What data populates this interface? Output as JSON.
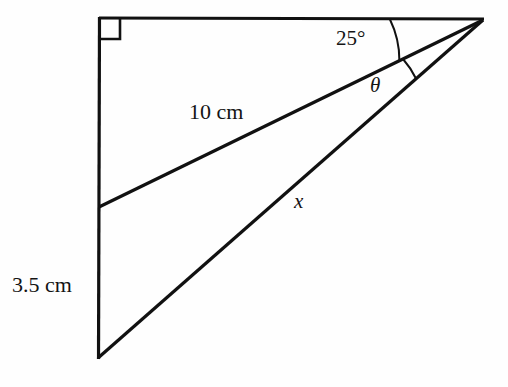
{
  "figure": {
    "background_color": "#fefefe",
    "stroke_color": "#111111",
    "canvas": {
      "width": 508,
      "height": 387
    },
    "vertices": {
      "top_left": {
        "x": 99,
        "y": 18
      },
      "right": {
        "x": 483,
        "y": 20
      },
      "bottom_left": {
        "x": 98,
        "y": 358
      },
      "mid_left": {
        "x": 99,
        "y": 207
      }
    },
    "segments": [
      {
        "name": "top-horizontal",
        "from": "top_left",
        "to": "right"
      },
      {
        "name": "left-vertical",
        "from": "top_left",
        "to": "bottom_left"
      },
      {
        "name": "hypotenuse-x",
        "from": "bottom_left",
        "to": "right"
      },
      {
        "name": "cevian-10cm",
        "from": "mid_left",
        "to": "right"
      }
    ],
    "right_angle_marker": {
      "at": "top_left",
      "size": 21
    }
  },
  "labels": {
    "side_10cm": "10 cm",
    "side_35cm": "3.5 cm",
    "angle_25": "25°",
    "angle_theta": "θ",
    "side_x": "x"
  },
  "angles": {
    "at_right_vertex": [
      {
        "name": "25-degree-angle",
        "label": "25°",
        "value": 25,
        "unit": "degrees",
        "between": [
          "top-horizontal",
          "cevian-10cm"
        ]
      },
      {
        "name": "theta-angle",
        "label": "θ",
        "value": null,
        "unit": "degrees",
        "between": [
          "cevian-10cm",
          "hypotenuse-x"
        ]
      }
    ],
    "at_top_left_vertex": [
      {
        "name": "right-angle",
        "label": "",
        "value": 90,
        "unit": "degrees",
        "between": [
          "top-horizontal",
          "left-vertical"
        ]
      }
    ]
  },
  "measurements": [
    {
      "name": "cevian-length",
      "label": "10 cm",
      "value": 10,
      "unit": "cm",
      "segment": "cevian-10cm"
    },
    {
      "name": "lower-left-side",
      "label": "3.5 cm",
      "value": 3.5,
      "unit": "cm",
      "segment": "left-vertical-lower"
    },
    {
      "name": "unknown-side",
      "label": "x",
      "value": null,
      "unit": "cm",
      "segment": "hypotenuse-x"
    }
  ]
}
